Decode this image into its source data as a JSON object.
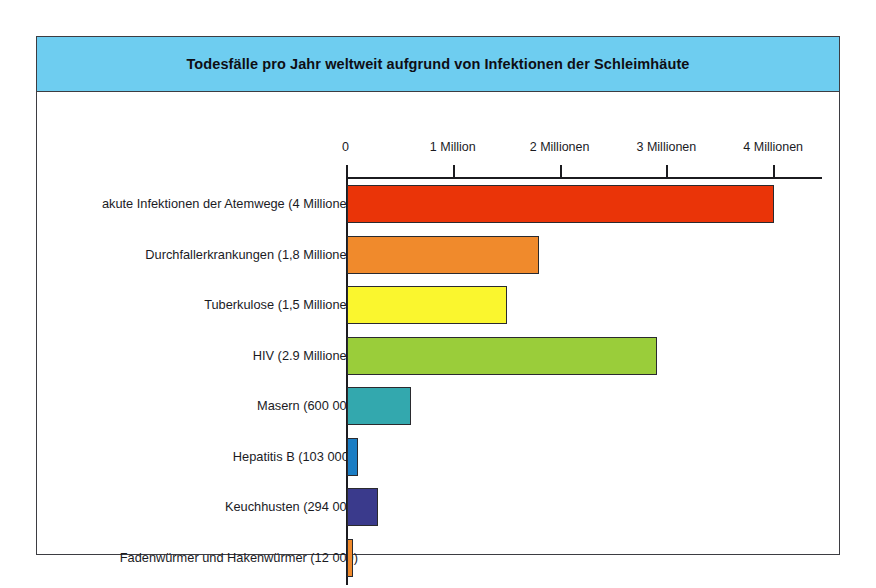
{
  "figure": {
    "title": "Todesfälle pro Jahr weltweit aufgrund von Infektionen der Schleimhäute",
    "header_color": "#6ECDF0",
    "frame_color": "#3D3D42",
    "background": "#FFFFFF"
  },
  "chart_data": {
    "type": "bar",
    "orientation": "horizontal",
    "title": "Todesfälle pro Jahr weltweit aufgrund von Infektionen der Schleimhäute",
    "xlabel": "",
    "ylabel": "",
    "xlim": [
      0,
      4450000
    ],
    "grid": false,
    "legend": null,
    "tick_labels": [
      "0",
      "1 Million",
      "2 Millionen",
      "3 Millionen",
      "4 Millionen"
    ],
    "tick_values": [
      0,
      1000000,
      2000000,
      3000000,
      4000000
    ],
    "categories": [
      "akute Infektionen der Atemwege (4 Millionen)",
      "Durchfallerkrankungen (1,8 Millionen)",
      "Tuberkulose (1,5 Millionen)",
      "HIV (2.9 Millionen)",
      "Masern (600 000)",
      "Hepatitis B (103 000*)",
      "Keuchhusten (294 000)",
      "Fadenwürmer und Hakenwürmer (12 000)"
    ],
    "values": [
      4000000,
      1800000,
      1500000,
      2900000,
      600000,
      103000,
      294000,
      12000
    ],
    "colors": [
      "#EA3408",
      "#F08A2C",
      "#FAF62E",
      "#9ACD3A",
      "#33A8AE",
      "#1A7DC4",
      "#3A3A8C",
      "#F08A2C"
    ],
    "bars": [
      {
        "label": "akute Infektionen der Atemwege (4 Millionen)",
        "value": 4000000,
        "color": "#EA3408"
      },
      {
        "label": "Durchfallerkrankungen (1,8 Millionen)",
        "value": 1800000,
        "color": "#F08A2C"
      },
      {
        "label": "Tuberkulose (1,5 Millionen)",
        "value": 1500000,
        "color": "#FAF62E"
      },
      {
        "label": "HIV (2.9 Millionen)",
        "value": 2900000,
        "color": "#9ACD3A"
      },
      {
        "label": "Masern (600 000)",
        "value": 600000,
        "color": "#33A8AE"
      },
      {
        "label": "Hepatitis B (103 000*)",
        "value": 103000,
        "color": "#1A7DC4"
      },
      {
        "label": "Keuchhusten (294 000)",
        "value": 294000,
        "color": "#3A3A8C"
      },
      {
        "label": "Fadenwürmer und Hakenwürmer (12 000)",
        "value": 12000,
        "color": "#F08A2C"
      }
    ]
  }
}
